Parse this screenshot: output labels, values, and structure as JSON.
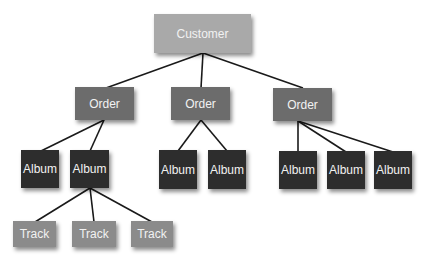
{
  "diagram": {
    "type": "tree",
    "colors": {
      "customer": "#a9a9a9",
      "order": "#6c6c6c",
      "album": "#2d2d2d",
      "track": "#8b8b8b",
      "edge": "#1a1a1a"
    },
    "nodes": {
      "customer": {
        "label": "Customer"
      },
      "order1": {
        "label": "Order"
      },
      "order2": {
        "label": "Order"
      },
      "order3": {
        "label": "Order"
      },
      "album1": {
        "label": "Album"
      },
      "album2": {
        "label": "Album"
      },
      "album3": {
        "label": "Album"
      },
      "album4": {
        "label": "Album"
      },
      "album5": {
        "label": "Album"
      },
      "album6": {
        "label": "Album"
      },
      "album7": {
        "label": "Album"
      },
      "track1": {
        "label": "Track"
      },
      "track2": {
        "label": "Track"
      },
      "track3": {
        "label": "Track"
      }
    },
    "edges": [
      [
        "customer",
        "order1"
      ],
      [
        "customer",
        "order2"
      ],
      [
        "customer",
        "order3"
      ],
      [
        "order1",
        "album1"
      ],
      [
        "order1",
        "album2"
      ],
      [
        "order2",
        "album3"
      ],
      [
        "order2",
        "album4"
      ],
      [
        "order3",
        "album5"
      ],
      [
        "order3",
        "album6"
      ],
      [
        "order3",
        "album7"
      ],
      [
        "album2",
        "track1"
      ],
      [
        "album2",
        "track2"
      ],
      [
        "album2",
        "track3"
      ]
    ]
  }
}
